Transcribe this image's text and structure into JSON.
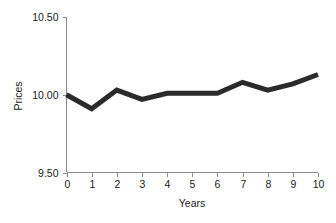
{
  "chart_data": {
    "type": "line",
    "title": "",
    "xlabel": "Years",
    "ylabel": "Prices",
    "x": [
      0,
      1,
      2,
      3,
      4,
      5,
      6,
      7,
      8,
      9,
      10
    ],
    "values": [
      10.0,
      9.91,
      10.03,
      9.97,
      10.01,
      10.01,
      10.01,
      10.08,
      10.03,
      10.07,
      10.13
    ],
    "series": [
      {
        "name": "Prices",
        "values": [
          10.0,
          9.91,
          10.03,
          9.97,
          10.01,
          10.01,
          10.01,
          10.08,
          10.03,
          10.07,
          10.13
        ],
        "color": "#2b2b2b"
      }
    ],
    "xlim": [
      0,
      10
    ],
    "ylim": [
      9.5,
      10.5
    ],
    "x_tick_labels": [
      "0",
      "1",
      "2",
      "3",
      "4",
      "5",
      "6",
      "7",
      "8",
      "9",
      "10"
    ],
    "y_tick_values": [
      9.5,
      10.0,
      10.5
    ],
    "y_tick_labels": [
      "9.50",
      "10.00",
      "10.50"
    ],
    "grid": false,
    "legend": "none",
    "line_color": "#2b2b2b",
    "axis_color": "#8a8a8a",
    "background_color": "#ffffff"
  }
}
